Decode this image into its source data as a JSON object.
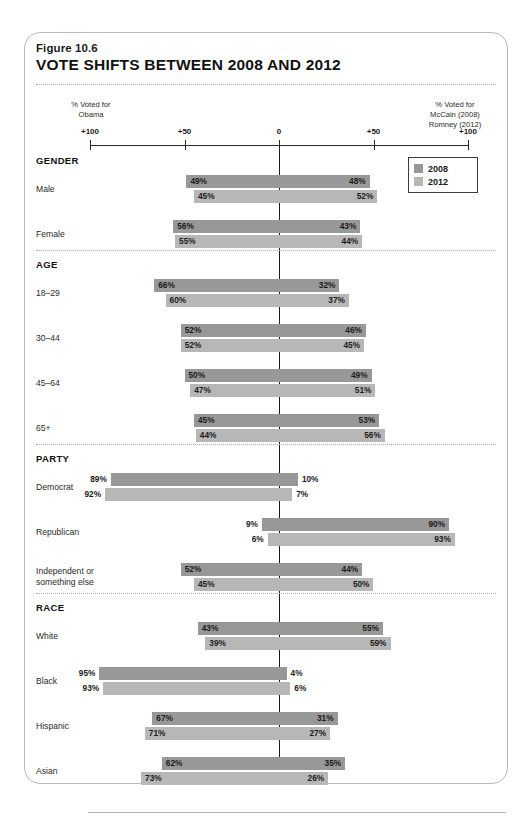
{
  "figure": {
    "number": "Figure 10.6",
    "title": "VOTE SHIFTS BETWEEN 2008 AND 2012"
  },
  "axis": {
    "left_caption": "% Voted for\nObama",
    "left_caption_line1": "% Voted for",
    "left_caption_line2": "Obama",
    "right_caption_line1": "% Voted for",
    "right_caption_line2": "McCain (2008)",
    "right_caption_line3": "Romney (2012)",
    "ticks": [
      "+100",
      "+50",
      "0",
      "+50",
      "+100"
    ]
  },
  "legend": {
    "items": [
      {
        "label": "2008",
        "color": "#989898"
      },
      {
        "label": "2012",
        "color": "#b7b7b7"
      }
    ]
  },
  "colors": {
    "series_2008": "#989898",
    "series_2012": "#b7b7b7",
    "axis": "#2a2a2a",
    "frame": "#b9b9b9"
  },
  "chart_data": {
    "type": "bar",
    "title": "VOTE SHIFTS BETWEEN 2008 AND 2012",
    "subtitle": "Figure 10.6",
    "orientation": "horizontal-diverging",
    "xlabel_left": "% Voted for Obama",
    "xlabel_right": "% Voted for McCain (2008) / Romney (2012)",
    "xlim": [
      -100,
      100
    ],
    "xticks": [
      -100,
      -50,
      0,
      50,
      100
    ],
    "xticklabels": [
      "+100",
      "+50",
      "0",
      "+50",
      "+100"
    ],
    "grid": false,
    "legend_position": "top-right",
    "series_names": [
      "2008",
      "2012"
    ],
    "groups": [
      {
        "name": "GENDER",
        "categories": [
          {
            "label": "Male",
            "rows": [
              {
                "series": "2008",
                "left": 49,
                "right": 48,
                "left_text": "49%",
                "right_text": "48%"
              },
              {
                "series": "2012",
                "left": 45,
                "right": 52,
                "left_text": "45%",
                "right_text": "52%"
              }
            ]
          },
          {
            "label": "Female",
            "rows": [
              {
                "series": "2008",
                "left": 56,
                "right": 43,
                "left_text": "56%",
                "right_text": "43%"
              },
              {
                "series": "2012",
                "left": 55,
                "right": 44,
                "left_text": "55%",
                "right_text": "44%"
              }
            ]
          }
        ]
      },
      {
        "name": "AGE",
        "categories": [
          {
            "label": "18–29",
            "rows": [
              {
                "series": "2008",
                "left": 66,
                "right": 32,
                "left_text": "66%",
                "right_text": "32%"
              },
              {
                "series": "2012",
                "left": 60,
                "right": 37,
                "left_text": "60%",
                "right_text": "37%"
              }
            ]
          },
          {
            "label": "30–44",
            "rows": [
              {
                "series": "2008",
                "left": 52,
                "right": 46,
                "left_text": "52%",
                "right_text": "46%"
              },
              {
                "series": "2012",
                "left": 52,
                "right": 45,
                "left_text": "52%",
                "right_text": "45%"
              }
            ]
          },
          {
            "label": "45–64",
            "rows": [
              {
                "series": "2008",
                "left": 50,
                "right": 49,
                "left_text": "50%",
                "right_text": "49%"
              },
              {
                "series": "2012",
                "left": 47,
                "right": 51,
                "left_text": "47%",
                "right_text": "51%"
              }
            ]
          },
          {
            "label": "65+",
            "rows": [
              {
                "series": "2008",
                "left": 45,
                "right": 53,
                "left_text": "45%",
                "right_text": "53%"
              },
              {
                "series": "2012",
                "left": 44,
                "right": 56,
                "left_text": "44%",
                "right_text": "56%"
              }
            ]
          }
        ]
      },
      {
        "name": "PARTY",
        "categories": [
          {
            "label": "Democrat",
            "rows": [
              {
                "series": "2008",
                "left": 89,
                "right": 10,
                "left_text": "89%",
                "right_text": "10%",
                "left_outside": true,
                "right_outside": true
              },
              {
                "series": "2012",
                "left": 92,
                "right": 7,
                "left_text": "92%",
                "right_text": "7%",
                "left_outside": true,
                "right_outside": true
              }
            ]
          },
          {
            "label": "Republican",
            "rows": [
              {
                "series": "2008",
                "left": 9,
                "right": 90,
                "left_text": "9%",
                "right_text": "90%",
                "left_outside": true
              },
              {
                "series": "2012",
                "left": 6,
                "right": 93,
                "left_text": "6%",
                "right_text": "93%",
                "left_outside": true
              }
            ]
          },
          {
            "label": "Independent or\nsomething else",
            "label_line1": "Independent or",
            "label_line2": "something else",
            "rows": [
              {
                "series": "2008",
                "left": 52,
                "right": 44,
                "left_text": "52%",
                "right_text": "44%"
              },
              {
                "series": "2012",
                "left": 45,
                "right": 50,
                "left_text": "45%",
                "right_text": "50%"
              }
            ]
          }
        ]
      },
      {
        "name": "RACE",
        "categories": [
          {
            "label": "White",
            "rows": [
              {
                "series": "2008",
                "left": 43,
                "right": 55,
                "left_text": "43%",
                "right_text": "55%"
              },
              {
                "series": "2012",
                "left": 39,
                "right": 59,
                "left_text": "39%",
                "right_text": "59%"
              }
            ]
          },
          {
            "label": "Black",
            "rows": [
              {
                "series": "2008",
                "left": 95,
                "right": 4,
                "left_text": "95%",
                "right_text": "4%",
                "left_outside": true,
                "right_outside": true
              },
              {
                "series": "2012",
                "left": 93,
                "right": 6,
                "left_text": "93%",
                "right_text": "6%",
                "left_outside": true,
                "right_outside": true
              }
            ]
          },
          {
            "label": "Hispanic",
            "rows": [
              {
                "series": "2008",
                "left": 67,
                "right": 31,
                "left_text": "67%",
                "right_text": "31%"
              },
              {
                "series": "2012",
                "left": 71,
                "right": 27,
                "left_text": "71%",
                "right_text": "27%"
              }
            ]
          },
          {
            "label": "Asian",
            "rows": [
              {
                "series": "2008",
                "left": 62,
                "right": 35,
                "left_text": "62%",
                "right_text": "35%"
              },
              {
                "series": "2012",
                "left": 73,
                "right": 26,
                "left_text": "73%",
                "right_text": "26%"
              }
            ]
          }
        ]
      }
    ]
  }
}
